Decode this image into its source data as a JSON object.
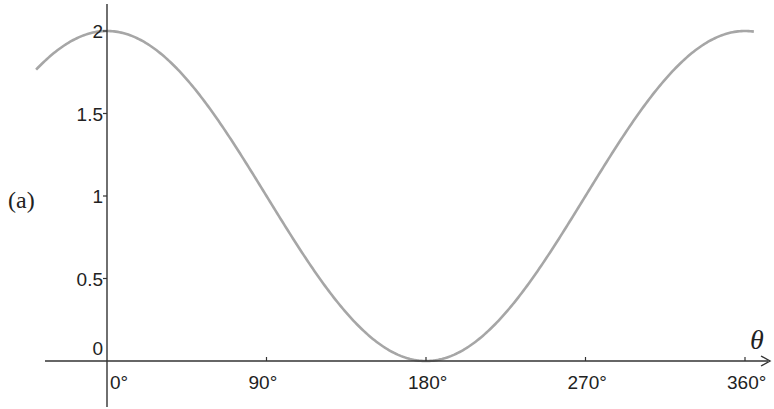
{
  "part_label": "(a)",
  "chart_data": {
    "type": "line",
    "title": "",
    "function": "y = 1 + cos(theta)",
    "xlabel": "θ",
    "ylabel": "",
    "x_unit": "degrees",
    "xlim": [
      -40,
      365
    ],
    "ylim": [
      0,
      2
    ],
    "grid": false,
    "legend": null,
    "x_ticks": [
      0,
      90,
      180,
      270,
      360
    ],
    "x_tick_labels": [
      "0°",
      "90°",
      "180°",
      "270°",
      "360°"
    ],
    "y_ticks": [
      0,
      0.5,
      1,
      1.5,
      2
    ],
    "y_tick_labels": [
      "0",
      "0.5",
      "1",
      "1.5",
      "2"
    ],
    "series": [
      {
        "name": "1 + cos θ",
        "color": "#a6a6a6",
        "x": [
          -40,
          -30,
          0,
          30,
          60,
          90,
          120,
          150,
          180,
          210,
          240,
          270,
          300,
          330,
          360,
          365
        ],
        "values": [
          1.77,
          1.87,
          2,
          1.87,
          1.5,
          1,
          0.5,
          0.13,
          0,
          0.13,
          0.5,
          1,
          1.5,
          1.87,
          2,
          2.0
        ]
      }
    ]
  }
}
